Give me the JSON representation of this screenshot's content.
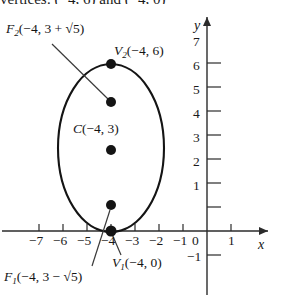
{
  "figure": {
    "title_fragment": "vertices: (−4, 6) and (−4, 0)",
    "type": "ellipse-on-coordinate-plane"
  },
  "axes": {
    "x_axis_label": "x",
    "y_axis_label": "y",
    "origin_label": "0",
    "x_ticks": [
      "−7",
      "−6",
      "−5",
      "−4",
      "−3",
      "−2",
      "−1",
      "1"
    ],
    "y_ticks": [
      "7",
      "6",
      "5",
      "4",
      "3",
      "2",
      "1",
      "−1"
    ],
    "x_range": [
      -7.8,
      1.9
    ],
    "y_range": [
      -1.4,
      7.6
    ]
  },
  "points": [
    {
      "id": "focus-upper",
      "name_main": "F",
      "name_sub": "2",
      "coords": "(−4, 3 + √5)",
      "label_full": "F₂(−4, 3 + √5)",
      "x": -4,
      "y": 5.236
    },
    {
      "id": "vertex-upper",
      "name_main": "V",
      "name_sub": "2",
      "coords": "(−4, 6)",
      "label_full": "V₂(−4, 6)",
      "x": -4,
      "y": 6
    },
    {
      "id": "center",
      "name_main": "C",
      "name_sub": "",
      "coords": "(−4, 3)",
      "label_full": "C(−4, 3)",
      "x": -4,
      "y": 3
    },
    {
      "id": "focus-lower",
      "name_main": "F",
      "name_sub": "1",
      "coords": "(−4, 3 − √5)",
      "label_full": "F₁(−4, 3 − √5)",
      "x": -4,
      "y": 0.764
    },
    {
      "id": "vertex-lower",
      "name_main": "V",
      "name_sub": "1",
      "coords": "(−4, 0)",
      "label_full": "V₁(−4, 0)",
      "x": -4,
      "y": 0
    }
  ],
  "curve": {
    "shape": "ellipse",
    "center_x": -4,
    "center_y": 3,
    "semi_major_vertical": 3,
    "semi_minor_horizontal": 2,
    "stroke_color": "#1a1a1a"
  },
  "colors": {
    "ink": "#1a1a1a",
    "axis": "#3a3a3a",
    "background": "#ffffff"
  }
}
